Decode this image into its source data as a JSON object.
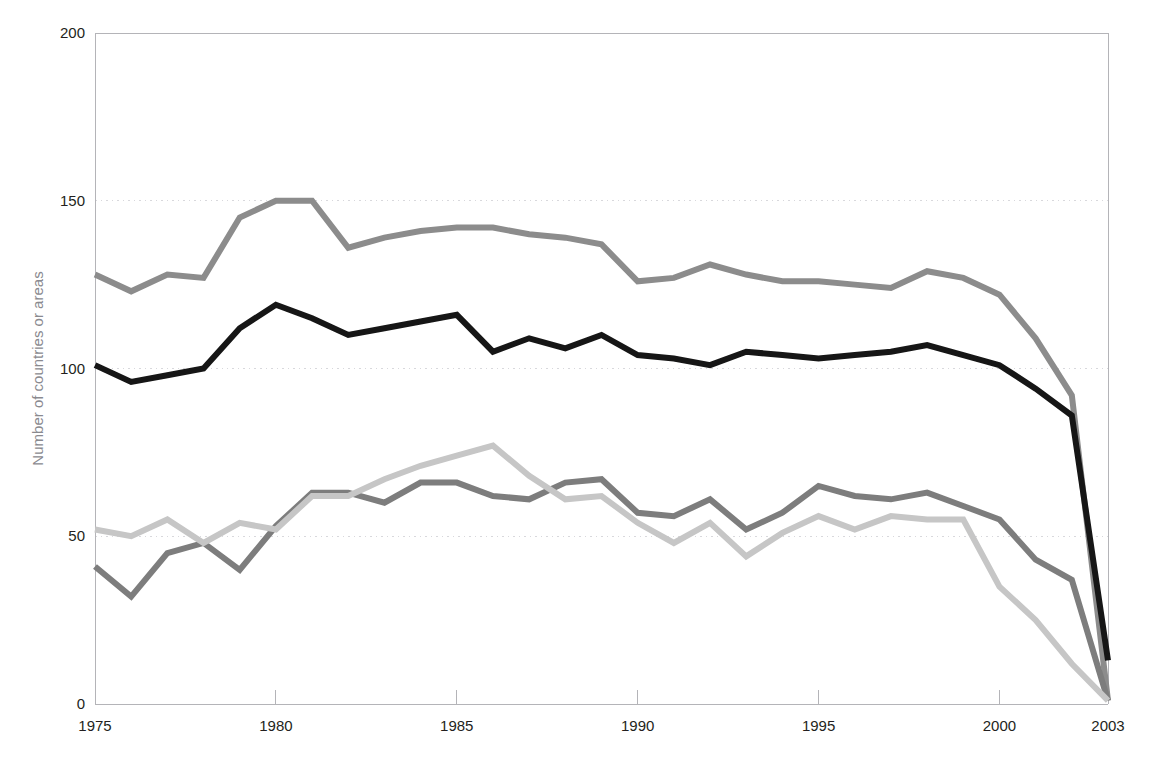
{
  "clipped_top_text": "",
  "chart_data": {
    "type": "line",
    "title": "",
    "xlabel": "",
    "ylabel": "Number of countries or areas",
    "xlim": [
      1975,
      2003
    ],
    "ylim": [
      0,
      200
    ],
    "yticks": [
      0,
      50,
      100,
      150,
      200
    ],
    "xticks": [
      1975,
      1980,
      1985,
      1990,
      1995,
      2000,
      2003
    ],
    "grid": "horizontal-dotted",
    "grid_color": "#d8d8dc",
    "axis_color": "#b4b4b8",
    "legend": "none",
    "x": [
      1975,
      1976,
      1977,
      1978,
      1979,
      1980,
      1981,
      1982,
      1983,
      1984,
      1985,
      1986,
      1987,
      1988,
      1989,
      1990,
      1991,
      1992,
      1993,
      1994,
      1995,
      1996,
      1997,
      1998,
      1999,
      2000,
      2001,
      2002,
      2003
    ],
    "series": [
      {
        "name": "series-1-medium-gray",
        "color": "#8c8c8c",
        "width": 6,
        "values": [
          128,
          123,
          128,
          127,
          145,
          150,
          150,
          136,
          139,
          141,
          142,
          142,
          140,
          139,
          137,
          126,
          127,
          131,
          128,
          126,
          126,
          125,
          124,
          129,
          127,
          122,
          109,
          92,
          1
        ]
      },
      {
        "name": "series-2-black",
        "color": "#161616",
        "width": 6,
        "values": [
          101,
          96,
          98,
          100,
          112,
          119,
          115,
          110,
          112,
          114,
          116,
          105,
          109,
          106,
          110,
          104,
          103,
          101,
          105,
          104,
          103,
          104,
          105,
          107,
          104,
          101,
          94,
          86,
          13
        ]
      },
      {
        "name": "series-3-dark-gray",
        "color": "#7d7d7d",
        "width": 6,
        "values": [
          41,
          32,
          45,
          48,
          40,
          53,
          63,
          63,
          60,
          66,
          66,
          62,
          61,
          66,
          67,
          57,
          56,
          61,
          52,
          57,
          65,
          62,
          61,
          63,
          59,
          55,
          43,
          37,
          1
        ]
      },
      {
        "name": "series-4-light-gray",
        "color": "#c6c6c6",
        "width": 6,
        "values": [
          52,
          50,
          55,
          48,
          54,
          52,
          62,
          62,
          67,
          71,
          74,
          77,
          68,
          61,
          62,
          54,
          48,
          54,
          44,
          51,
          56,
          52,
          56,
          55,
          55,
          35,
          25,
          12,
          1
        ]
      }
    ]
  }
}
